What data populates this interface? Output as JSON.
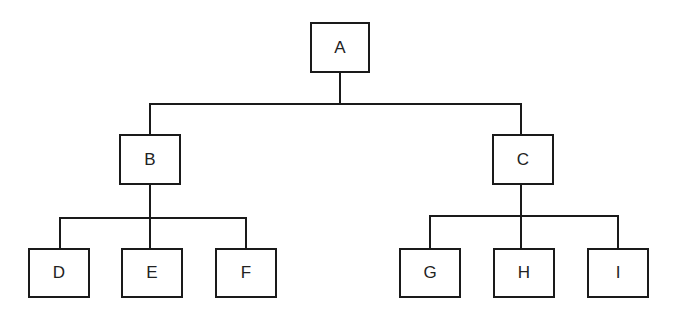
{
  "diagram": {
    "type": "tree",
    "nodes": [
      {
        "id": "A",
        "label": "A",
        "x": 310,
        "y": 22,
        "w": 60,
        "h": 51
      },
      {
        "id": "B",
        "label": "B",
        "x": 119,
        "y": 134,
        "w": 62,
        "h": 51
      },
      {
        "id": "C",
        "label": "C",
        "x": 492,
        "y": 134,
        "w": 62,
        "h": 51
      },
      {
        "id": "D",
        "label": "D",
        "x": 28,
        "y": 248,
        "w": 62,
        "h": 50
      },
      {
        "id": "E",
        "label": "E",
        "x": 121,
        "y": 248,
        "w": 62,
        "h": 50
      },
      {
        "id": "F",
        "label": "F",
        "x": 215,
        "y": 248,
        "w": 62,
        "h": 50
      },
      {
        "id": "G",
        "label": "G",
        "x": 399,
        "y": 248,
        "w": 62,
        "h": 50
      },
      {
        "id": "H",
        "label": "H",
        "x": 493,
        "y": 248,
        "w": 62,
        "h": 50
      },
      {
        "id": "I",
        "label": "I",
        "x": 587,
        "y": 248,
        "w": 62,
        "h": 50
      }
    ],
    "edges": [
      [
        "A",
        "B"
      ],
      [
        "A",
        "C"
      ],
      [
        "B",
        "D"
      ],
      [
        "B",
        "E"
      ],
      [
        "B",
        "F"
      ],
      [
        "C",
        "G"
      ],
      [
        "C",
        "H"
      ],
      [
        "C",
        "I"
      ]
    ]
  }
}
